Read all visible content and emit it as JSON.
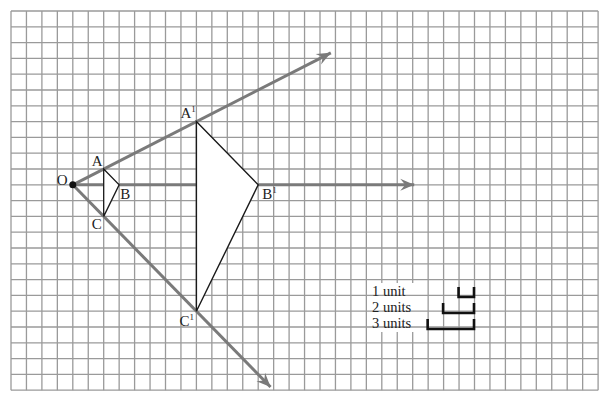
{
  "grid": {
    "columns": 38,
    "rows": 24,
    "origin_px": [
      11,
      11
    ],
    "cell_w": 15.45,
    "cell_h": 15.8,
    "line_color": "#9a9a9a"
  },
  "center": {
    "label": "O",
    "grid": [
      4,
      11
    ]
  },
  "original_triangle": {
    "vertices": [
      {
        "label": "A",
        "grid": [
          6,
          10
        ]
      },
      {
        "label": "B",
        "grid": [
          7,
          11
        ]
      },
      {
        "label": "C",
        "grid": [
          6,
          13
        ]
      }
    ]
  },
  "image_triangle": {
    "vertices": [
      {
        "label": "A'",
        "display": "A",
        "prime": "1",
        "grid": [
          12,
          7
        ]
      },
      {
        "label": "B'",
        "display": "B",
        "prime": "1",
        "grid": [
          16,
          11
        ]
      },
      {
        "label": "C'",
        "display": "C",
        "prime": "1",
        "grid": [
          12,
          19
        ]
      }
    ],
    "scale_factor": 4
  },
  "rays": [
    {
      "name": "ray-through-A",
      "from": [
        4,
        11
      ],
      "to": [
        20.7,
        2.65
      ],
      "color": "#7a7a7a"
    },
    {
      "name": "ray-through-B",
      "from": [
        4,
        11
      ],
      "to": [
        26.1,
        11
      ],
      "color": "#7a7a7a"
    },
    {
      "name": "ray-through-C",
      "from": [
        4,
        11
      ],
      "to": [
        16.8,
        23.8
      ],
      "color": "#7a7a7a"
    }
  ],
  "legend": {
    "items": [
      {
        "label": "1 unit",
        "units": 1
      },
      {
        "label": "2 units",
        "units": 2
      },
      {
        "label": "3 units",
        "units": 3
      }
    ]
  }
}
